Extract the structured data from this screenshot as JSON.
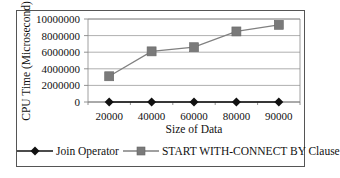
{
  "chart_data": {
    "type": "line",
    "title": "",
    "xlabel": "Size of Data",
    "ylabel": "CPU Time (Microsecond)",
    "categories": [
      "20000",
      "40000",
      "60000",
      "80000",
      "90000"
    ],
    "yticks": [
      "0",
      "2000000",
      "4000000",
      "6000000",
      "8000000",
      "10000000"
    ],
    "ylim": [
      0,
      10000000
    ],
    "grid": true,
    "legend_position": "bottom",
    "series": [
      {
        "name": "Join Operator",
        "marker": "diamond",
        "color": "#111111",
        "values": [
          0,
          0,
          0,
          0,
          0
        ]
      },
      {
        "name": "START WITH-CONNECT BY Clause",
        "marker": "square",
        "color": "#808080",
        "values": [
          3100000,
          6100000,
          6600000,
          8500000,
          9300000
        ]
      }
    ]
  },
  "legend": {
    "join_label": "Join Operator",
    "startwith_label": "START WITH-CONNECT BY Clause"
  }
}
